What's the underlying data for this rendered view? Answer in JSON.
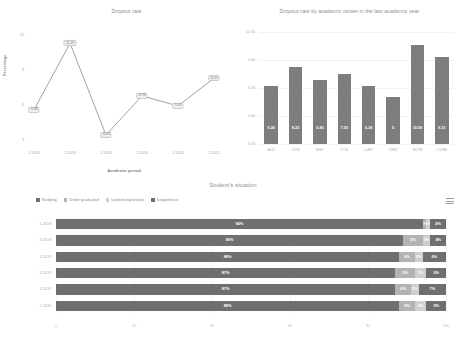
{
  "dashboard": {
    "menu_icon": "hamburger-menu-icon"
  },
  "chart_data": [
    {
      "type": "line",
      "title": "Dropout rate",
      "xlabel": "Academic period",
      "ylabel": "Percentage",
      "categories": [
        "2-2018",
        "1-2019",
        "2-2019",
        "1-2020",
        "2-2020",
        "1-2021"
      ],
      "values": [
        5.58,
        11.29,
        3.43,
        6.78,
        5.92,
        8.29
      ],
      "point_labels": [
        "5.58",
        "11.29",
        "3.43",
        "6.78",
        "5.92",
        "8.29"
      ],
      "yticks": [
        "12",
        "9",
        "6",
        "3"
      ],
      "ylim": [
        3,
        12
      ],
      "grid": false,
      "legend": "none",
      "series_color": "#8c8c8c"
    },
    {
      "type": "bar",
      "title": "Dropout rate by academic center in the last academic year",
      "xlabel": "",
      "ylabel": "",
      "categories": [
        "ACD",
        "CCN",
        "EIST",
        "CCS",
        "LUET",
        "CINO",
        "SCTN",
        "CCHE"
      ],
      "values": [
        6.26,
        8.22,
        6.83,
        7.55,
        6.26,
        5.0,
        10.59,
        9.31
      ],
      "bar_labels": [
        "6.26",
        "8.22",
        "6.83",
        "7.55",
        "6.26",
        "5",
        "10.59",
        "9.31"
      ],
      "yticks": [
        "12.00",
        "9.00",
        "6.00",
        "3.00",
        "0.00"
      ],
      "ylim": [
        0,
        12
      ],
      "grid": true,
      "legend": "none",
      "series_color": "#7d7d7d"
    },
    {
      "type": "bar",
      "subtype": "stacked-horizontal-100",
      "title": "Student's situation",
      "xlabel": "",
      "ylabel": "",
      "categories": [
        "1-2018",
        "2-2018",
        "1-2019",
        "2-2019",
        "1-2020",
        "2-2020"
      ],
      "xticks": [
        "0",
        "20",
        "40",
        "60",
        "80",
        "100"
      ],
      "xlim": [
        0,
        100
      ],
      "legend_position": "top-left",
      "series": [
        {
          "name": "Studying",
          "color": "#6f6f6f",
          "values": [
            94,
            89,
            88,
            87,
            87,
            88
          ],
          "labels": [
            "94%",
            "89%",
            "88%",
            "87%",
            "87%",
            "88%"
          ]
        },
        {
          "name": "Under graduated",
          "color": "#b3b3b3",
          "values": [
            1,
            5,
            4,
            5,
            4,
            4
          ],
          "labels": [
            "1%",
            "5%",
            "4%",
            "5%",
            "4%",
            "4%"
          ]
        },
        {
          "name": "Looked registration",
          "color": "#cfcfcf",
          "values": [
            1,
            2,
            2,
            3,
            2,
            3
          ],
          "labels": [
            "1%",
            "2%",
            "2%",
            "3%",
            "2%",
            "3%"
          ]
        },
        {
          "name": "Dropped out",
          "color": "#6f6f6f",
          "values": [
            4,
            4,
            6,
            5,
            7,
            5
          ],
          "labels": [
            "4%",
            "4%",
            "6%",
            "5%",
            "7%",
            "5%"
          ]
        }
      ]
    }
  ]
}
